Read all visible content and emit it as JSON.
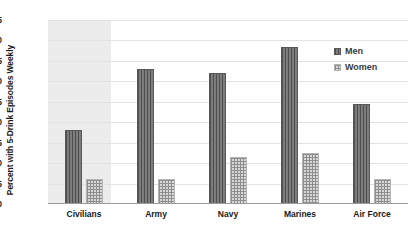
{
  "chart_data": {
    "type": "bar",
    "title": "",
    "xlabel": "",
    "ylabel": "Percent with 5-Drink Episodes Weekly",
    "categories": [
      "Civilians",
      "Army",
      "Navy",
      "Marines",
      "Air Force"
    ],
    "series": [
      {
        "name": "Men",
        "values": [
          18,
          33,
          32,
          38.5,
          24.5
        ]
      },
      {
        "name": "Women",
        "values": [
          6,
          6,
          11.5,
          12.5,
          6
        ]
      }
    ],
    "ylim": [
      0,
      45
    ],
    "yticks": [
      0,
      5,
      10,
      15,
      20,
      25,
      30,
      35,
      40,
      45
    ],
    "ytick_labels": [
      "0",
      "5",
      "10",
      "15",
      "20",
      "25",
      "30",
      "35",
      "40",
      "45"
    ],
    "grid": true,
    "legend_position": "right",
    "legend": [
      {
        "label": "Men",
        "pattern": "vertical-lines",
        "color": "#6e6e6e"
      },
      {
        "label": "Women",
        "pattern": "grid-dots",
        "color": "#d8d8d8"
      }
    ],
    "highlighted_category": "Civilians",
    "highlight_color": "#ececed"
  }
}
